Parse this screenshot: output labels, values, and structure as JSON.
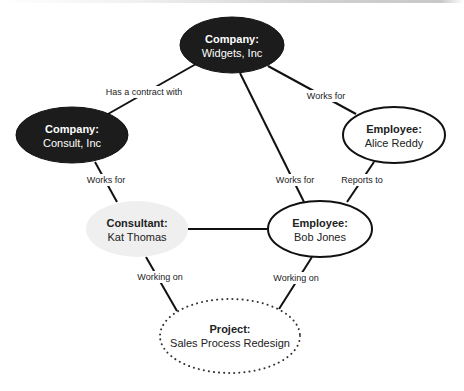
{
  "colors": {
    "dark_fill": "#1c1c1c",
    "dark_text": "#ffffff",
    "light_fill": "#efefef",
    "outline": "#111111",
    "text": "#222222"
  },
  "nodes": {
    "widgets": {
      "title": "Company:",
      "name": "Widgets, Inc",
      "style": "dark"
    },
    "consult": {
      "title": "Company:",
      "name": "Consult, Inc",
      "style": "dark"
    },
    "alice": {
      "title": "Employee:",
      "name": "Alice Reddy",
      "style": "outline"
    },
    "kat": {
      "title": "Consultant:",
      "name": "Kat Thomas",
      "style": "light"
    },
    "bob": {
      "title": "Employee:",
      "name": "Bob Jones",
      "style": "outline"
    },
    "project": {
      "title": "Project:",
      "name": "Sales Process Redesign",
      "style": "dotted"
    }
  },
  "edges": {
    "consult_widgets": "Has a contract with",
    "alice_widgets": "Works for",
    "bob_widgets": "Works for",
    "kat_consult": "Works for",
    "bob_alice": "Reports to",
    "kat_bob": "",
    "kat_project": "Working on",
    "bob_project": "Working on"
  }
}
